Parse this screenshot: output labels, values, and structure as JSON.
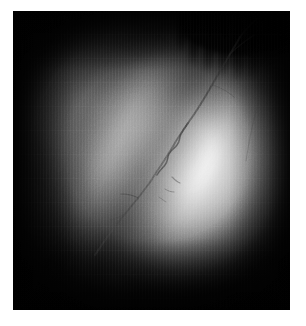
{
  "page": {
    "width": 306,
    "height": 326,
    "background_color": "#ffffff",
    "caption": ""
  },
  "image": {
    "name": "grayscale-medical-photograph",
    "alt_text": "Monochrome close-up photograph showing a large bright elliptical body on a dark background, crossed by a dark diagonal groove and a branching vessel, with dark finger-like projections at the upper right.",
    "modality": "grayscale photograph",
    "color_mode": "grayscale",
    "frame": {
      "left": 13,
      "top": 11,
      "width": 277,
      "height": 299,
      "border_color": "#ffffff",
      "field_color": "#050505"
    },
    "tone": {
      "darkest_hex": "#050505",
      "shadow_hex": "#1a1a1a",
      "midtone_hex": "#6e6e6e",
      "highlight_hex": "#e8e8e8",
      "brightest_hex": "#fdfdfd"
    },
    "features": [
      {
        "name": "bright-central-body",
        "label": "Bright elliptical body",
        "center_x_pct": 62,
        "center_y_pct": 50,
        "tone": "highlight"
      },
      {
        "name": "upper-left-lobe",
        "label": "Upper-left gray lobe",
        "center_x_pct": 31,
        "center_y_pct": 33,
        "tone": "midtone"
      },
      {
        "name": "diagonal-groove",
        "label": "Dark diagonal groove",
        "angle_deg": 26,
        "tone": "shadow"
      },
      {
        "name": "branching-vessel",
        "label": "Branching dark vessel",
        "tone": "shadow"
      },
      {
        "name": "ciliary-processes",
        "label": "Dark finger-like projections",
        "center_x_pct": 84,
        "center_y_pct": 10,
        "tone": "darkest"
      },
      {
        "name": "vignette",
        "label": "Edge vignetting",
        "tone": "darkest"
      }
    ]
  }
}
